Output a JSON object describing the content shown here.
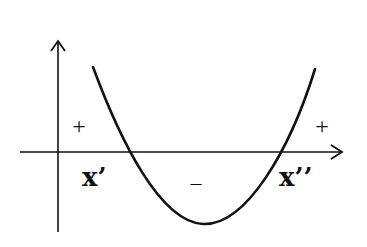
{
  "diagram": {
    "type": "parabola-sign-chart",
    "colors": {
      "background": "#ffffff",
      "stroke": "#111111"
    },
    "axes": {
      "x_axis": {
        "arrow": true
      },
      "y_axis": {
        "arrow": true
      }
    },
    "roots": [
      {
        "label": "x’"
      },
      {
        "label": "x’’"
      }
    ],
    "signs": {
      "left": "+",
      "middle": "–",
      "right": "+"
    }
  }
}
